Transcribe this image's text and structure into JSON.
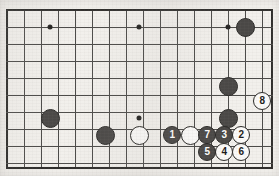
{
  "diagram": {
    "type": "go-board-diagram",
    "board": {
      "grid_spacing": 17.05,
      "left": 6.5,
      "top": 10.0,
      "right": 272.0,
      "bottom": 168.0,
      "columns": 16,
      "rows": 10,
      "line_color": "#4b4a48",
      "edge_color": "#2e2d2b",
      "background_color": "#f2f0ec"
    },
    "star_points": [
      {
        "name": "star-point-top-left",
        "x": 50,
        "y": 27
      },
      {
        "name": "star-point-top-center",
        "x": 139,
        "y": 27
      },
      {
        "name": "star-point-top-right",
        "x": 228,
        "y": 27
      },
      {
        "name": "star-point-center",
        "x": 139,
        "y": 118
      }
    ],
    "stones": [
      {
        "name": "black-stone-top-right",
        "color": "black",
        "label": "",
        "x": 245,
        "y": 27,
        "r": 9.5
      },
      {
        "name": "black-stone-right-upper",
        "color": "black",
        "label": "",
        "x": 228,
        "y": 86,
        "r": 9.5
      },
      {
        "name": "black-stone-right-lower",
        "color": "black",
        "label": "",
        "x": 228,
        "y": 118,
        "r": 9.5
      },
      {
        "name": "black-stone-left",
        "color": "black",
        "label": "",
        "x": 50,
        "y": 118,
        "r": 9.5
      },
      {
        "name": "black-stone-bottom-left",
        "color": "black",
        "label": "",
        "x": 105,
        "y": 135,
        "r": 9.5
      },
      {
        "name": "white-stone-bottom-center",
        "color": "white",
        "label": "",
        "x": 139,
        "y": 135,
        "r": 9.5
      },
      {
        "name": "white-stone-bottom-right-area",
        "color": "white",
        "label": "",
        "x": 190,
        "y": 135,
        "r": 9.5
      },
      {
        "name": "numbered-stone-1",
        "color": "black",
        "label": "1",
        "x": 172,
        "y": 135,
        "r": 9.0
      },
      {
        "name": "numbered-stone-2",
        "color": "white",
        "label": "2",
        "x": 241,
        "y": 135,
        "r": 9.0
      },
      {
        "name": "numbered-stone-3",
        "color": "black",
        "label": "3",
        "x": 224,
        "y": 135,
        "r": 9.0
      },
      {
        "name": "numbered-stone-4",
        "color": "white",
        "label": "4",
        "x": 224,
        "y": 152,
        "r": 9.0
      },
      {
        "name": "numbered-stone-5",
        "color": "black",
        "label": "5",
        "x": 207,
        "y": 152,
        "r": 9.0
      },
      {
        "name": "numbered-stone-6",
        "color": "white",
        "label": "6",
        "x": 241,
        "y": 152,
        "r": 9.0
      },
      {
        "name": "numbered-stone-7",
        "color": "black",
        "label": "7",
        "x": 207,
        "y": 135,
        "r": 9.0
      },
      {
        "name": "numbered-stone-8",
        "color": "white",
        "label": "8",
        "x": 262,
        "y": 101,
        "r": 9.0
      }
    ]
  }
}
